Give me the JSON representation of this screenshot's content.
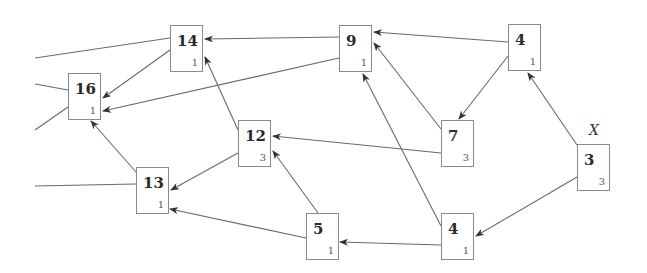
{
  "diagram": {
    "nodes": [
      {
        "id": "n14",
        "label": "14",
        "sub": "1",
        "x": 170,
        "y": 25
      },
      {
        "id": "n16",
        "label": "16",
        "sub": "1",
        "x": 68,
        "y": 73
      },
      {
        "id": "n9",
        "label": "9",
        "sub": "1",
        "x": 339,
        "y": 25
      },
      {
        "id": "n4a",
        "label": "4",
        "sub": "1",
        "x": 508,
        "y": 24
      },
      {
        "id": "n12",
        "label": "12",
        "sub": "3",
        "x": 238,
        "y": 120
      },
      {
        "id": "n7",
        "label": "7",
        "sub": "3",
        "x": 441,
        "y": 120
      },
      {
        "id": "n3",
        "label": "3",
        "sub": "3",
        "x": 577,
        "y": 144
      },
      {
        "id": "n13",
        "label": "13",
        "sub": "1",
        "x": 136,
        "y": 167
      },
      {
        "id": "n5",
        "label": "5",
        "sub": "1",
        "x": 306,
        "y": 213
      },
      {
        "id": "n4b",
        "label": "4",
        "sub": "1",
        "x": 441,
        "y": 213
      }
    ],
    "x_label": {
      "text": "X",
      "x": 589,
      "y": 122
    },
    "edges": [
      {
        "from": "n9",
        "to": "n14",
        "x1": 339,
        "y1": 37,
        "x2": 205,
        "y2": 39,
        "arrow": true
      },
      {
        "from": "n4a",
        "to": "n9",
        "x1": 508,
        "y1": 42,
        "x2": 374,
        "y2": 32,
        "arrow": true
      },
      {
        "from": "n4a",
        "to": "n7",
        "x1": 508,
        "y1": 56,
        "x2": 459,
        "y2": 119,
        "arrow": true
      },
      {
        "from": "n7",
        "to": "n9",
        "x1": 441,
        "y1": 129,
        "x2": 374,
        "y2": 43,
        "arrow": true
      },
      {
        "from": "n4b",
        "to": "n9",
        "x1": 441,
        "y1": 226,
        "x2": 363,
        "y2": 74,
        "arrow": true
      },
      {
        "from": "n7",
        "to": "n12",
        "x1": 441,
        "y1": 153,
        "x2": 273,
        "y2": 136,
        "arrow": true
      },
      {
        "from": "n3",
        "to": "n4a",
        "x1": 577,
        "y1": 145,
        "x2": 528,
        "y2": 73,
        "arrow": true
      },
      {
        "from": "n3",
        "to": "n4b",
        "x1": 577,
        "y1": 177,
        "x2": 476,
        "y2": 236,
        "arrow": true
      },
      {
        "from": "n4b",
        "to": "n5",
        "x1": 441,
        "y1": 245,
        "x2": 340,
        "y2": 242,
        "arrow": true
      },
      {
        "from": "n5",
        "to": "n12",
        "x1": 318,
        "y1": 213,
        "x2": 273,
        "y2": 151,
        "arrow": true
      },
      {
        "from": "n5",
        "to": "n13",
        "x1": 306,
        "y1": 238,
        "x2": 170,
        "y2": 209,
        "arrow": true
      },
      {
        "from": "n12",
        "to": "n13",
        "x1": 238,
        "y1": 153,
        "x2": 171,
        "y2": 190,
        "arrow": true
      },
      {
        "from": "n12",
        "to": "n14",
        "x1": 238,
        "y1": 130,
        "x2": 205,
        "y2": 57,
        "arrow": true
      },
      {
        "from": "n14",
        "to": "n16",
        "x1": 170,
        "y1": 50,
        "x2": 103,
        "y2": 98,
        "arrow": true
      },
      {
        "from": "n9",
        "to": "n16",
        "x1": 339,
        "y1": 58,
        "x2": 103,
        "y2": 111,
        "arrow": true
      },
      {
        "from": "n13",
        "to": "n16",
        "x1": 136,
        "y1": 172,
        "x2": 91,
        "y2": 121,
        "arrow": true
      },
      {
        "from": "ext",
        "to": "n14",
        "x1": 35,
        "y1": 58,
        "x2": 170,
        "y2": 38,
        "arrow": false
      },
      {
        "from": "ext",
        "to": "n16",
        "x1": 35,
        "y1": 84,
        "x2": 68,
        "y2": 90,
        "arrow": false
      },
      {
        "from": "ext",
        "to": "n16",
        "x1": 35,
        "y1": 130,
        "x2": 68,
        "y2": 107,
        "arrow": false
      },
      {
        "from": "ext",
        "to": "n13",
        "x1": 35,
        "y1": 186,
        "x2": 136,
        "y2": 184,
        "arrow": false
      }
    ]
  },
  "colors": {
    "edge": "#6a6a6a",
    "border": "#8a8a8a",
    "text": "#2a2a2a"
  }
}
